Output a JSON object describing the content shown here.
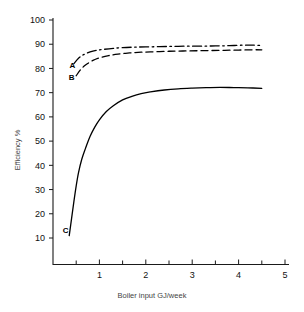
{
  "chart_data": {
    "type": "line",
    "title": "",
    "xlabel": "Boiler input GJ/week",
    "ylabel": "Efficiency  %",
    "xlim": [
      0,
      5
    ],
    "ylim": [
      0,
      100
    ],
    "xticks": [
      1,
      2,
      3,
      4,
      5
    ],
    "xtick_labels": [
      "1",
      "2",
      "3",
      "4",
      "5"
    ],
    "xminor_ticks": [
      0.5,
      1.5,
      2.5,
      3.5,
      4.5
    ],
    "yticks": [
      10,
      20,
      30,
      40,
      50,
      60,
      70,
      80,
      90,
      100
    ],
    "ytick_labels": [
      "10",
      "20",
      "30",
      "40",
      "50",
      "60",
      "70",
      "80",
      "90",
      "100"
    ],
    "grid": false,
    "legend": "inline-curve-labels",
    "series": [
      {
        "name": "A",
        "label": "A",
        "style": "dash-dot",
        "color": "#000000",
        "label_x": 0.42,
        "label_y": 81.5,
        "x": [
          0.45,
          0.55,
          0.65,
          0.8,
          0.95,
          1.1,
          1.3,
          1.5,
          1.75,
          2.0,
          2.3,
          2.6,
          2.9,
          3.2,
          3.5,
          3.8,
          4.1,
          4.3,
          4.5
        ],
        "y": [
          82.0,
          84.2,
          85.6,
          86.8,
          87.5,
          87.9,
          88.3,
          88.6,
          88.8,
          88.9,
          89.0,
          89.1,
          89.2,
          89.2,
          89.3,
          89.4,
          89.6,
          89.6,
          89.5
        ]
      },
      {
        "name": "B",
        "label": "B",
        "style": "dashed",
        "color": "#000000",
        "label_x": 0.4,
        "label_y": 76.5,
        "x": [
          0.5,
          0.6,
          0.7,
          0.85,
          1.0,
          1.2,
          1.4,
          1.65,
          1.9,
          2.2,
          2.5,
          2.8,
          3.1,
          3.4,
          3.7,
          4.0,
          4.3,
          4.5
        ],
        "y": [
          77.0,
          79.6,
          81.4,
          83.2,
          84.4,
          85.3,
          85.9,
          86.4,
          86.7,
          86.9,
          87.1,
          87.2,
          87.3,
          87.4,
          87.5,
          87.6,
          87.7,
          87.7
        ]
      },
      {
        "name": "C",
        "label": "C",
        "style": "solid",
        "color": "#000000",
        "label_x": 0.27,
        "label_y": 13.5,
        "x": [
          0.35,
          0.4,
          0.45,
          0.5,
          0.55,
          0.62,
          0.7,
          0.8,
          0.9,
          1.0,
          1.15,
          1.3,
          1.5,
          1.7,
          1.9,
          2.1,
          2.4,
          2.7,
          3.0,
          3.3,
          3.6,
          3.9,
          4.2,
          4.5
        ],
        "y": [
          11.0,
          18.0,
          25.0,
          31.5,
          37.0,
          42.5,
          47.0,
          52.0,
          55.8,
          58.8,
          62.2,
          64.6,
          67.0,
          68.5,
          69.6,
          70.3,
          71.1,
          71.6,
          71.9,
          72.1,
          72.2,
          72.1,
          72.0,
          71.8
        ]
      }
    ]
  }
}
